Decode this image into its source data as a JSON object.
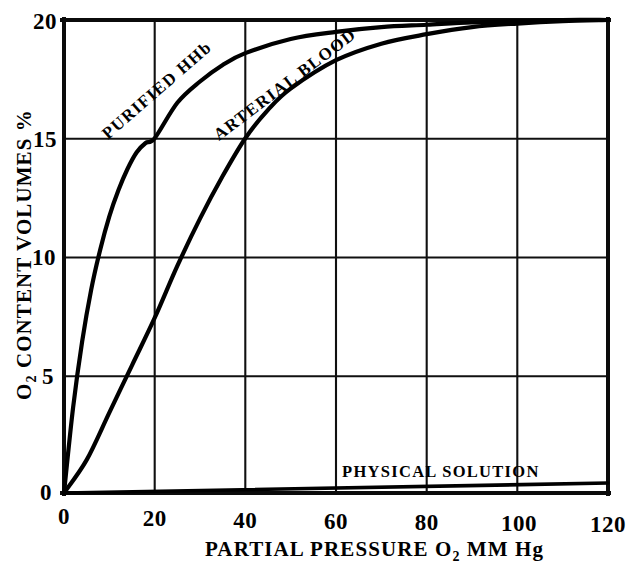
{
  "figure": {
    "background_color": "#ffffff",
    "ink_color": "#000000",
    "style": "hand-drawn scanned textbook line graph, black ink on white paper, no title"
  },
  "axes": {
    "x": {
      "label_main": "PARTIAL PRESSURE O",
      "label_sub": "2",
      "label_tail": " MM Hg",
      "label_full": "PARTIAL PRESSURE O2 MM Hg",
      "ticks": [
        "0",
        "20",
        "40",
        "60",
        "80",
        "100",
        "120"
      ],
      "tick_values": [
        0,
        20,
        40,
        60,
        80,
        100,
        120
      ],
      "min": 0,
      "max": 120,
      "unit": "mm Hg"
    },
    "y": {
      "label_main": "O",
      "label_sub": "2",
      "label_tail": " CONTENT VOLUMES %",
      "label_full": "O2 CONTENT VOLUMES %",
      "ticks": [
        "0",
        "5",
        "10",
        "15",
        "20"
      ],
      "tick_values": [
        0,
        5,
        10,
        15,
        20
      ],
      "min": 0,
      "max": 20,
      "unit": "volumes %"
    }
  },
  "curve_labels": {
    "purified_hhb": "PURIFIED HHb",
    "arterial_blood": "ARTERIAL BLOOD",
    "physical_solution": "PHYSICAL SOLUTION"
  },
  "chart_data": {
    "type": "line",
    "title": "",
    "subtitle": "",
    "xlabel": "PARTIAL PRESSURE O2 MM Hg",
    "ylabel": "O2 CONTENT VOLUMES %",
    "xlim": [
      0,
      120
    ],
    "ylim": [
      0,
      20
    ],
    "xticks": [
      0,
      20,
      40,
      60,
      80,
      100,
      120
    ],
    "yticks": [
      0,
      5,
      10,
      15,
      20
    ],
    "grid": true,
    "grid_style": "full rectangular grid, solid thin black lines at every tick",
    "legend": "none (curves labelled inline along each trace)",
    "series": [
      {
        "name": "PURIFIED HHb",
        "shape": "hyperbolic / rectangular-hyperbola saturation curve, rises very steeply from origin",
        "label_position": "along the curve between x=18 and x=48, rotated to follow the rising slope",
        "x": [
          0,
          2,
          4,
          6,
          8,
          10,
          12,
          14,
          16,
          18,
          20,
          25,
          30,
          35,
          40,
          50,
          60,
          70,
          80,
          90,
          100,
          110,
          120
        ],
        "y": [
          0,
          3.6,
          6.4,
          8.6,
          10.3,
          11.7,
          12.8,
          13.7,
          14.4,
          14.8,
          15.0,
          16.5,
          17.4,
          18.1,
          18.6,
          19.2,
          19.5,
          19.7,
          19.8,
          19.9,
          19.95,
          20.0,
          20.0
        ],
        "key_points": [
          {
            "x": 20,
            "y": 15.0,
            "note": "crosses the 15 gridline exactly at 20 mm Hg"
          },
          {
            "x": 40,
            "y": 18.6
          },
          {
            "x": 120,
            "y": 20.0,
            "note": "asymptotic to 20 volumes %"
          }
        ]
      },
      {
        "name": "ARTERIAL BLOOD",
        "shape": "sigmoid oxyhemoglobin dissociation curve, shifted right of purified HHb",
        "label_position": "along the curve between x=33 and x=72, rotated to follow the rising slope",
        "x": [
          0,
          5,
          10,
          15,
          20,
          25,
          30,
          35,
          40,
          45,
          50,
          60,
          70,
          80,
          90,
          100,
          110,
          120
        ],
        "y": [
          0,
          1.4,
          3.4,
          5.4,
          7.4,
          9.6,
          11.6,
          13.4,
          15.0,
          16.2,
          17.1,
          18.3,
          19.0,
          19.4,
          19.7,
          19.85,
          19.95,
          20.0
        ],
        "key_points": [
          {
            "x": 40,
            "y": 15.0,
            "note": "crosses the 15 gridline exactly at 40 mm Hg"
          },
          {
            "x": 20,
            "y": 7.4
          },
          {
            "x": 120,
            "y": 20.0,
            "note": "asymptotic to 20 volumes %"
          }
        ]
      },
      {
        "name": "PHYSICAL SOLUTION",
        "shape": "straight line of very small positive slope (dissolved oxygen)",
        "label_position": "above the line, horizontal, spanning roughly x=62 to x=115",
        "x": [
          0,
          120
        ],
        "y": [
          0,
          0.42
        ],
        "key_points": [
          {
            "x": 0,
            "y": 0
          },
          {
            "x": 120,
            "y": 0.42,
            "note": "approximately 0.4 volumes % at 120 mm Hg"
          }
        ]
      }
    ]
  }
}
